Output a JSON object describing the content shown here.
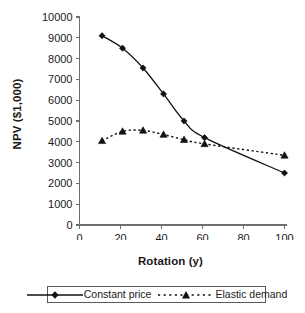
{
  "chart_data": {
    "type": "line",
    "title": "",
    "xlabel": "Rotation (y)",
    "ylabel": "NPV ($1,000)",
    "xlim": [
      0,
      100
    ],
    "ylim": [
      0,
      10000
    ],
    "grid": false,
    "legend_position": "bottom",
    "x_ticks": [
      0,
      20,
      40,
      60,
      80,
      100
    ],
    "x_tick_labels": [
      "0",
      "20",
      "40",
      "60",
      "80",
      "100"
    ],
    "y_ticks": [
      0,
      1000,
      2000,
      3000,
      4000,
      5000,
      6000,
      7000,
      8000,
      9000,
      10000
    ],
    "y_tick_labels": [
      "0",
      "1000",
      "2000",
      "3000",
      "4000",
      "5000",
      "6000",
      "7000",
      "8000",
      "9000",
      "10000"
    ],
    "series": [
      {
        "name": "Constant price",
        "marker": "diamond",
        "linestyle": "solid",
        "color": "#111111",
        "x": [
          11,
          21,
          31,
          41,
          51,
          61,
          100
        ],
        "values": [
          9100,
          8500,
          7550,
          6300,
          5000,
          4200,
          2500
        ]
      },
      {
        "name": "Elastic demand",
        "marker": "triangle",
        "linestyle": "dotted",
        "color": "#111111",
        "x": [
          11,
          21,
          31,
          41,
          51,
          61,
          100
        ],
        "values": [
          4050,
          4500,
          4550,
          4350,
          4100,
          3900,
          3350
        ]
      }
    ]
  },
  "axes": {
    "xlabel": "Rotation (y)",
    "ylabel": "NPV ($1,000)"
  },
  "legend": {
    "items": [
      {
        "label": "Constant price",
        "marker": "diamond",
        "linestyle": "solid"
      },
      {
        "label": "Elastic demand",
        "marker": "triangle",
        "linestyle": "dotted"
      }
    ]
  }
}
